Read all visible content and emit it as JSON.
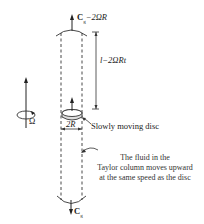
{
  "diagram": {
    "top_velocity_label": "C₀−2ΩR",
    "top_velocity_main": "C",
    "top_velocity_sub": "g",
    "top_velocity_rest": "−2ΩR",
    "length_label": "l−2ΩRt",
    "rotation_label": "Ω",
    "width_label": "2R",
    "disc_label": "Slowly moving disc",
    "column_caption": [
      "The fluid in the",
      "Taylor column moves upward",
      "at the same speed as the disc"
    ],
    "bottom_velocity_main": "C",
    "bottom_velocity_sub": "g"
  }
}
